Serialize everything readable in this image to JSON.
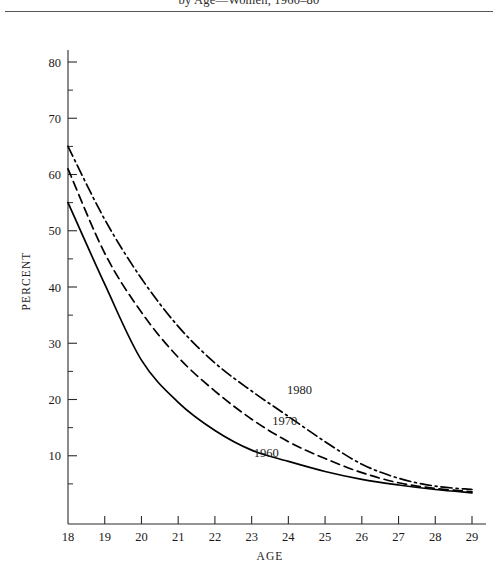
{
  "title": {
    "text": "by Age—Women, 1960–80"
  },
  "chart_data": {
    "type": "line",
    "title": "by Age—Women, 1960–80",
    "xlabel": "AGE",
    "ylabel": "PERCENT",
    "xlim": [
      18,
      29
    ],
    "ylim": [
      0,
      80
    ],
    "xticks": [
      18,
      19,
      20,
      21,
      22,
      23,
      24,
      25,
      26,
      27,
      28,
      29
    ],
    "yticks": [
      10,
      20,
      30,
      40,
      50,
      60,
      70,
      80
    ],
    "yticks_minor": [
      5,
      15,
      25,
      35,
      45,
      55,
      65,
      75
    ],
    "grid": false,
    "legend_position": "inline-annotations",
    "x": [
      18,
      19,
      20,
      21,
      22,
      23,
      24,
      25,
      26,
      27,
      28,
      29
    ],
    "series": [
      {
        "name": "1980",
        "style": "dash-dot",
        "label": "1980",
        "values": [
          65.0,
          52.0,
          41.5,
          33.0,
          26.5,
          21.5,
          17.0,
          12.5,
          8.5,
          6.0,
          4.6,
          4.0
        ]
      },
      {
        "name": "1970",
        "style": "dashed",
        "label": "1970",
        "values": [
          61.0,
          46.0,
          35.5,
          27.5,
          21.5,
          16.5,
          12.5,
          9.5,
          7.0,
          5.2,
          4.2,
          3.6
        ]
      },
      {
        "name": "1960",
        "style": "solid",
        "label": "1960",
        "values": [
          55.0,
          40.5,
          27.0,
          19.5,
          14.5,
          11.0,
          9.0,
          7.2,
          5.8,
          4.8,
          4.0,
          3.4
        ]
      }
    ],
    "annotations": [
      {
        "text": "1980",
        "x": 24.3,
        "y": 21.0
      },
      {
        "text": "1970",
        "x": 23.9,
        "y": 15.5
      },
      {
        "text": "1960",
        "x": 23.4,
        "y": 9.8
      }
    ]
  },
  "axes": {
    "x_title": "AGE",
    "y_title": "PERCENT"
  },
  "colors": {
    "ink": "#1a1a1a",
    "curve": "#000000",
    "rule": "#555555",
    "background": "#ffffff"
  }
}
